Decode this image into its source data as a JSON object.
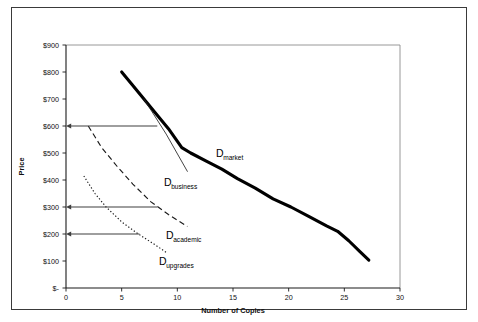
{
  "chart_data": {
    "type": "line",
    "title": "",
    "xlabel": "Number of Copies",
    "ylabel": "Price",
    "xlim": [
      0,
      30
    ],
    "ylim": [
      0,
      900
    ],
    "grid": false,
    "legend_position": "inline-labels",
    "xticks": [
      "0",
      "5",
      "10",
      "15",
      "20",
      "25",
      "30"
    ],
    "xtick_values": [
      0,
      5,
      10,
      15,
      20,
      25,
      30
    ],
    "yticks": [
      "$-",
      "$100",
      "$200",
      "$300",
      "$400",
      "$500",
      "$600",
      "$700",
      "$800",
      "$900"
    ],
    "ytick_values": [
      0,
      100,
      200,
      300,
      400,
      500,
      600,
      700,
      800,
      900
    ],
    "series": [
      {
        "name": "D_market",
        "label_main": "D",
        "label_sub": "market",
        "style": "thick-solid",
        "points": [
          [
            5.0,
            800
          ],
          [
            5.8,
            760
          ],
          [
            7.0,
            700
          ],
          [
            8.2,
            640
          ],
          [
            9.2,
            590
          ],
          [
            10.4,
            520
          ],
          [
            11.2,
            500
          ],
          [
            12.6,
            470
          ],
          [
            14.0,
            440
          ],
          [
            15.4,
            405
          ],
          [
            17.0,
            370
          ],
          [
            18.6,
            330
          ],
          [
            20.2,
            300
          ],
          [
            21.8,
            265
          ],
          [
            23.4,
            230
          ],
          [
            24.4,
            210
          ],
          [
            25.4,
            175
          ],
          [
            26.4,
            135
          ],
          [
            27.2,
            103
          ]
        ]
      },
      {
        "name": "D_business",
        "label_main": "D",
        "label_sub": "business",
        "style": "thin-solid",
        "points": [
          [
            7.0,
            700
          ],
          [
            9.0,
            570
          ],
          [
            10.9,
            432
          ]
        ]
      },
      {
        "name": "D_academic",
        "label_main": "D",
        "label_sub": "academic",
        "style": "dashed",
        "points": [
          [
            2.0,
            600
          ],
          [
            3.2,
            520
          ],
          [
            4.6,
            450
          ],
          [
            6.0,
            385
          ],
          [
            7.6,
            320
          ],
          [
            9.2,
            272
          ],
          [
            10.9,
            228
          ]
        ]
      },
      {
        "name": "D_upgrades",
        "label_main": "D",
        "label_sub": "upgrades",
        "style": "dotted",
        "points": [
          [
            1.6,
            415
          ],
          [
            2.6,
            350
          ],
          [
            3.6,
            300
          ],
          [
            5.0,
            245
          ],
          [
            6.5,
            200
          ],
          [
            8.0,
            160
          ],
          [
            9.0,
            132
          ]
        ]
      }
    ],
    "annotations": [
      {
        "name": "price-marker-600",
        "price": 600,
        "label": "$600",
        "x_end": 8.2
      },
      {
        "name": "price-marker-300",
        "price": 300,
        "label": "$300",
        "x_end": 8.2
      },
      {
        "name": "price-marker-200",
        "price": 200,
        "label": "$200",
        "x_end": 6.6
      }
    ]
  },
  "colors": {
    "curve": "#000000",
    "axis": "#1a1a1a",
    "frame": "#3a3a3a",
    "background": "#ffffff"
  }
}
